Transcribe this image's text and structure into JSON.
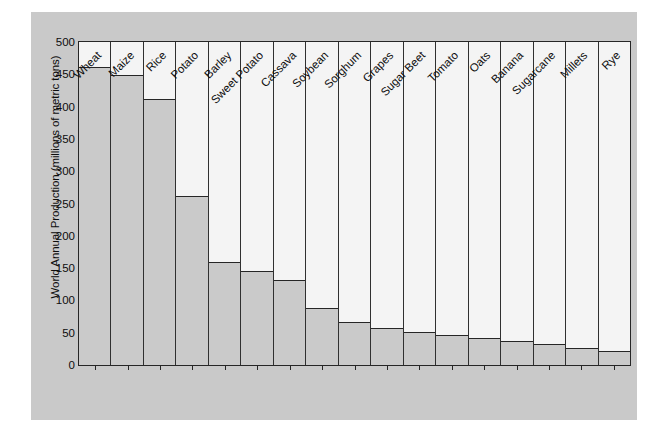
{
  "chart_data": {
    "type": "bar",
    "title": "",
    "xlabel": "",
    "ylabel": "World Annual Production (millions of metric tons)",
    "ylim": [
      0,
      500
    ],
    "yticks": [
      0,
      50,
      100,
      150,
      200,
      250,
      300,
      350,
      400,
      450,
      500
    ],
    "grid": false,
    "legend": null,
    "categories": [
      "Wheat",
      "Maize",
      "Rice",
      "Potato",
      "Barley",
      "Sweet Potato",
      "Cassava",
      "Soybean",
      "Sorghum",
      "Grapes",
      "Sugar Beet",
      "Tomato",
      "Oats",
      "Banana",
      "Sugarcane",
      "Millets",
      "Rye"
    ],
    "values": [
      462,
      449,
      412,
      261,
      160,
      145,
      131,
      89,
      66,
      58,
      51,
      47,
      42,
      37,
      32,
      27,
      22
    ],
    "bar_fill_color": "#cacaca",
    "bar_empty_color": "#f4f4f4",
    "bar_outline_color": "#262626",
    "panel_color": "#c9c9c9",
    "axis_color": "#262626",
    "text_color": "#0d0d0d"
  }
}
